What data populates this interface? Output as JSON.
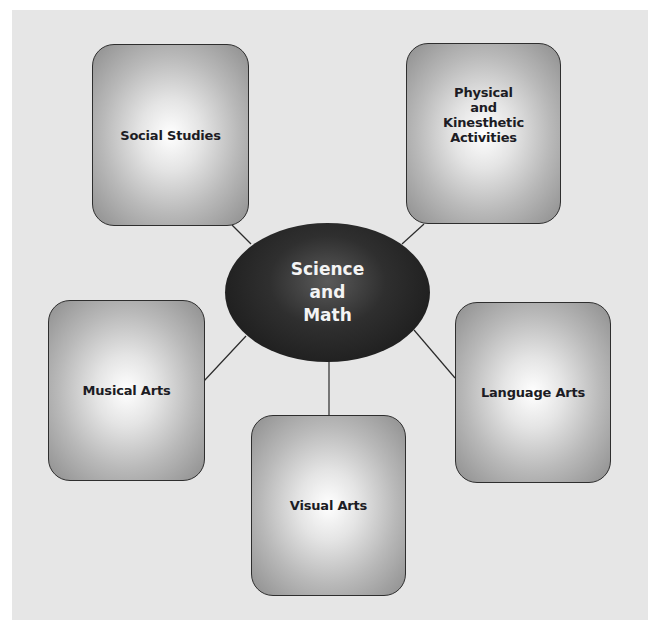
{
  "diagram": {
    "type": "concept-web",
    "background_color": "#e6e6e6",
    "center": {
      "label": "Science\nand\nMath",
      "color": "#1f1f1f"
    },
    "nodes": [
      {
        "id": "social-studies",
        "label": "Social Studies",
        "position": "top-left"
      },
      {
        "id": "physical",
        "label": "Physical\nand\nKinesthetic\nActivities",
        "position": "top-right"
      },
      {
        "id": "musical-arts",
        "label": "Musical Arts",
        "position": "middle-left"
      },
      {
        "id": "language-arts",
        "label": "Language Arts",
        "position": "middle-right"
      },
      {
        "id": "visual-arts",
        "label": "Visual Arts",
        "position": "bottom-center"
      }
    ],
    "edges": [
      [
        "center",
        "social-studies"
      ],
      [
        "center",
        "physical"
      ],
      [
        "center",
        "musical-arts"
      ],
      [
        "center",
        "language-arts"
      ],
      [
        "center",
        "visual-arts"
      ]
    ]
  }
}
